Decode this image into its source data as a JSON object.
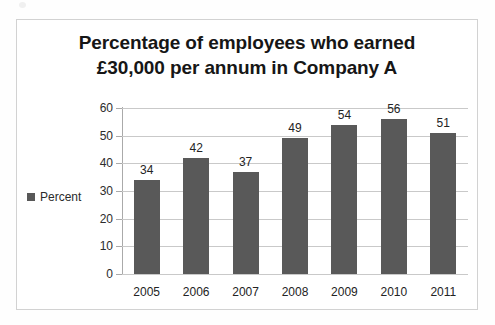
{
  "chart_data": {
    "type": "bar",
    "title": "Percentage of employees who earned £30,000 per annum in Company A",
    "title_line1": "Percentage of employees who earned",
    "title_line2": "£30,000 per annum in Company A",
    "categories": [
      "2005",
      "2006",
      "2007",
      "2008",
      "2009",
      "2010",
      "2011"
    ],
    "values": [
      34,
      42,
      37,
      49,
      54,
      56,
      51
    ],
    "series": [
      {
        "name": "Percent",
        "values": [
          34,
          42,
          37,
          49,
          54,
          56,
          51
        ],
        "color": "#595959"
      }
    ],
    "data_labels": [
      "34",
      "42",
      "37",
      "49",
      "54",
      "56",
      "51"
    ],
    "xlabel": "",
    "ylabel": "",
    "ylim": [
      0,
      60
    ],
    "y_ticks": [
      0,
      10,
      20,
      30,
      40,
      50,
      60
    ],
    "y_tick_labels": [
      "0",
      "10",
      "20",
      "30",
      "40",
      "50",
      "60"
    ],
    "grid": true,
    "grid_axis": "y",
    "legend": {
      "position": "left",
      "entries": [
        {
          "label": "Percent",
          "color": "#595959"
        }
      ]
    },
    "colors": {
      "bar": "#595959",
      "gridline": "#c9c9c9",
      "axis": "#aaaaaa",
      "text": "#232323",
      "title": "#161616",
      "frame": "#d2d2d2",
      "background": "#ffffff"
    }
  }
}
